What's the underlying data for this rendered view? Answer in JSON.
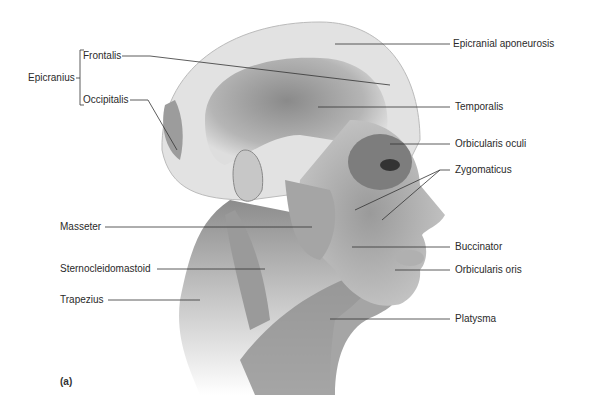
{
  "figure": {
    "panel_label": "(a)",
    "colors": {
      "line": "#333333",
      "text": "#2a2a2a",
      "illustration_dark": "#555555",
      "illustration_light": "#dcdcdc"
    }
  },
  "labels_left": {
    "group": "Epicranius",
    "frontalis": "Frontalis",
    "occipitalis": "Occipitalis",
    "masseter": "Masseter",
    "sternocleidomastoid": "Sternocleidomastoid",
    "trapezius": "Trapezius"
  },
  "labels_right": {
    "epicranial_aponeurosis": "Epicranial aponeurosis",
    "temporalis": "Temporalis",
    "orbicularis_oculi": "Orbicularis oculi",
    "zygomaticus": "Zygomaticus",
    "buccinator": "Buccinator",
    "orbicularis_oris": "Orbicularis oris",
    "platysma": "Platysma"
  }
}
